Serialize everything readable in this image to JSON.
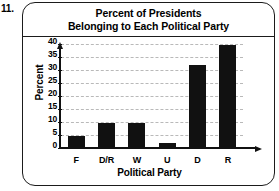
{
  "item_number": "11.",
  "chart_data": {
    "type": "bar",
    "title": "Percent of Presidents Belonging to Each Political Party",
    "title_lines": [
      "Percent of Presidents",
      "Belonging to Each Political Party"
    ],
    "categories": [
      "F",
      "D/R",
      "W",
      "U",
      "D",
      "R"
    ],
    "values": [
      5,
      10,
      10,
      2.5,
      32.5,
      40
    ],
    "xlabel": "Political Party",
    "ylabel": "Percent",
    "ylim": [
      0,
      40
    ],
    "ytick_labels": [
      "0",
      "5",
      "10",
      "15",
      "20",
      "25",
      "30",
      "35",
      "40"
    ],
    "ytick_values": [
      0,
      5,
      10,
      15,
      20,
      25,
      30,
      35,
      40
    ],
    "grid": true,
    "legend": "none",
    "bar_color": "#111111",
    "grid_color": "#b9b9b9",
    "axis_color": "#111111"
  }
}
